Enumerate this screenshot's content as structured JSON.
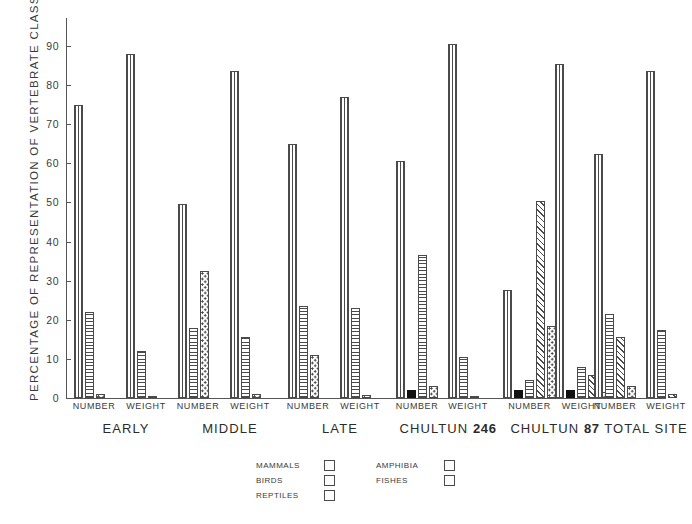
{
  "chart_data": {
    "type": "bar",
    "title": "",
    "ylabel": "PERCENTAGE OF REPRESENTATION OF VERTEBRATE CLASSES",
    "xlabel": "",
    "ylim": [
      0,
      95
    ],
    "yticks": [
      0,
      10,
      20,
      30,
      40,
      50,
      60,
      70,
      80,
      90
    ],
    "ytick_labels": [
      "0",
      "10",
      "20",
      "30",
      "40",
      "50",
      "60",
      "70",
      "80",
      "90"
    ],
    "grid": false,
    "legend_position": "bottom-center",
    "legend": [
      {
        "name": "MAMMALS",
        "pattern": "vertical-lines"
      },
      {
        "name": "AMPHIBIA",
        "pattern": "diagonal-hatch"
      },
      {
        "name": "BIRDS",
        "pattern": "solid-black"
      },
      {
        "name": "FISHES",
        "pattern": "dotted"
      },
      {
        "name": "REPTILES",
        "pattern": "horizontal-lines"
      }
    ],
    "series": [
      {
        "name": "MAMMALS",
        "class": "pat-mammals"
      },
      {
        "name": "BIRDS",
        "class": "pat-birds"
      },
      {
        "name": "REPTILES",
        "class": "pat-reptiles"
      },
      {
        "name": "AMPHIBIA",
        "class": "pat-amphibia"
      },
      {
        "name": "FISHES",
        "class": "pat-fishes"
      }
    ],
    "groups": [
      {
        "label": "EARLY",
        "label_bold": "",
        "subgroups": [
          {
            "label": "NUMBER",
            "bars": [
              {
                "series": "MAMMALS",
                "value": 75.0
              },
              {
                "series": "REPTILES",
                "value": 22.0
              },
              {
                "series": "FISHES",
                "value": 1.0
              }
            ]
          },
          {
            "label": "WEIGHT",
            "bars": [
              {
                "series": "MAMMALS",
                "value": 88.0
              },
              {
                "series": "REPTILES",
                "value": 12.0
              },
              {
                "series": "FISHES",
                "value": 0.5
              }
            ]
          }
        ]
      },
      {
        "label": "MIDDLE",
        "label_bold": "",
        "subgroups": [
          {
            "label": "NUMBER",
            "bars": [
              {
                "series": "MAMMALS",
                "value": 49.5
              },
              {
                "series": "REPTILES",
                "value": 18.0
              },
              {
                "series": "FISHES",
                "value": 32.5
              }
            ]
          },
          {
            "label": "WEIGHT",
            "bars": [
              {
                "series": "MAMMALS",
                "value": 83.5
              },
              {
                "series": "REPTILES",
                "value": 15.5
              },
              {
                "series": "FISHES",
                "value": 1.0
              }
            ]
          }
        ]
      },
      {
        "label": "LATE",
        "label_bold": "",
        "subgroups": [
          {
            "label": "NUMBER",
            "bars": [
              {
                "series": "MAMMALS",
                "value": 65.0
              },
              {
                "series": "REPTILES",
                "value": 23.5
              },
              {
                "series": "FISHES",
                "value": 11.0
              }
            ]
          },
          {
            "label": "WEIGHT",
            "bars": [
              {
                "series": "MAMMALS",
                "value": 77.0
              },
              {
                "series": "REPTILES",
                "value": 23.0
              },
              {
                "series": "FISHES",
                "value": 0.8
              }
            ]
          }
        ]
      },
      {
        "label": "CHULTUN",
        "label_bold": "246",
        "subgroups": [
          {
            "label": "NUMBER",
            "bars": [
              {
                "series": "MAMMALS",
                "value": 60.5
              },
              {
                "series": "BIRDS",
                "value": 2.0
              },
              {
                "series": "REPTILES",
                "value": 36.5
              },
              {
                "series": "FISHES",
                "value": 3.0
              }
            ]
          },
          {
            "label": "WEIGHT",
            "bars": [
              {
                "series": "MAMMALS",
                "value": 90.5
              },
              {
                "series": "REPTILES",
                "value": 10.5
              },
              {
                "series": "FISHES",
                "value": 0.6
              }
            ]
          }
        ]
      },
      {
        "label": "CHULTUN",
        "label_bold": "87",
        "subgroups": [
          {
            "label": "NUMBER",
            "bars": [
              {
                "series": "MAMMALS",
                "value": 27.5
              },
              {
                "series": "BIRDS",
                "value": 2.0
              },
              {
                "series": "REPTILES",
                "value": 4.5
              },
              {
                "series": "AMPHIBIA",
                "value": 50.5
              },
              {
                "series": "FISHES",
                "value": 18.5
              }
            ]
          },
          {
            "label": "WEIGHT",
            "bars": [
              {
                "series": "MAMMALS",
                "value": 85.5
              },
              {
                "series": "BIRDS",
                "value": 2.0
              },
              {
                "series": "REPTILES",
                "value": 8.0
              },
              {
                "series": "AMPHIBIA",
                "value": 6.0
              },
              {
                "series": "FISHES",
                "value": 1.5
              }
            ]
          }
        ]
      },
      {
        "label": "TOTAL SITE",
        "label_bold": "",
        "subgroups": [
          {
            "label": "NUMBER",
            "bars": [
              {
                "series": "MAMMALS",
                "value": 62.5
              },
              {
                "series": "REPTILES",
                "value": 21.5
              },
              {
                "series": "AMPHIBIA",
                "value": 15.5
              },
              {
                "series": "FISHES",
                "value": 3.0
              }
            ]
          },
          {
            "label": "WEIGHT",
            "bars": [
              {
                "series": "MAMMALS",
                "value": 83.5
              },
              {
                "series": "REPTILES",
                "value": 17.5
              },
              {
                "series": "AMPHIBIA",
                "value": 1.0
              }
            ]
          }
        ]
      }
    ]
  },
  "colors": {
    "ink": "#4a4a4a",
    "axis": "#555555",
    "black_swatch": "#111111",
    "background": "#ffffff"
  }
}
